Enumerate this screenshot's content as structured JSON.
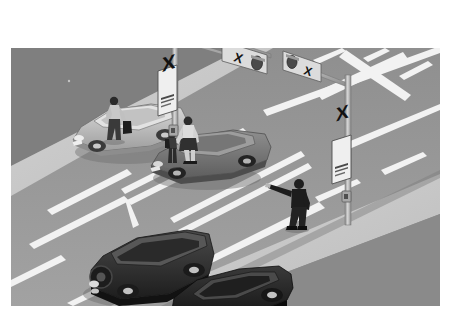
{
  "scene": {
    "title": "Road intersection with railway level crossing signals",
    "type": "illustration",
    "palette": {
      "page_background": "#ffffff",
      "sky_or_far_road": "#8c8c8c",
      "road_surface": "#9a9a9a",
      "road_surface_dark": "#858585",
      "sidewalk": "#c9c9c9",
      "verge": "#b4b4b4",
      "lane_marking": "#f2f2f2",
      "pole_metal": "#b9b9b9",
      "pole_shadow": "#7e7e7e",
      "sign_face": "#f0f0f0",
      "sign_ink": "#1c1c1c",
      "signal_housing": "#dcdcdc",
      "car_light": "#c6c6c6",
      "car_mid": "#7c7c7c",
      "car_dark": "#2e2e2e",
      "car_black": "#1a1a1a",
      "person_dark": "#262626",
      "person_light": "#d0d0d0",
      "shadow": "#6f6f6f"
    },
    "frame": {
      "left": 11,
      "top": 48,
      "width": 429,
      "height": 258
    }
  },
  "signs": {
    "crossbuck_left": {
      "name": "railway-crossbuck-sign",
      "glyph": "X",
      "subtext": "RAILWAY CROSSING"
    },
    "crossbuck_right": {
      "name": "railway-crossbuck-sign",
      "glyph": "X",
      "subtext": "RAILWAY CROSSING"
    }
  },
  "signals": {
    "overhead_left": {
      "label": "overhead-crossing-signal",
      "glyph": "X",
      "lamp_count": 1,
      "lamp_state": "off"
    },
    "overhead_right": {
      "label": "overhead-crossing-signal",
      "glyph": "X",
      "lamp_count": 1,
      "lamp_state": "off"
    }
  },
  "poles": [
    {
      "name": "signal-mast-left",
      "has_mast_arm": true,
      "has_control_box": true
    },
    {
      "name": "signal-mast-right",
      "has_mast_arm": true,
      "has_control_box": true
    }
  ],
  "vehicles": [
    {
      "name": "silver-sedan",
      "color": "#c6c6c6",
      "position": "upper-left-lane",
      "heading": "right"
    },
    {
      "name": "gray-sedan",
      "color": "#7c7c7c",
      "position": "upper-right-lane",
      "heading": "right"
    },
    {
      "name": "dark-suv",
      "color": "#2e2e2e",
      "position": "lower-left-lane",
      "heading": "left",
      "has_spare_tire": true
    },
    {
      "name": "black-sedan",
      "color": "#1a1a1a",
      "position": "lower-right-lane",
      "heading": "left"
    }
  ],
  "pedestrians": [
    {
      "name": "man-with-bag",
      "description": "man walking on sidewalk carrying a bag",
      "clothing": "light shirt, dark trousers"
    },
    {
      "name": "woman-with-child",
      "description": "woman holding child's hand crossing at crosswalk",
      "clothing": "light top, dark skirt"
    },
    {
      "name": "child",
      "description": "child with backpack held by the hand",
      "clothing": "dark outfit"
    },
    {
      "name": "person-pointing",
      "description": "person in dark clothing with arm extended pointing",
      "clothing": "dark jacket and trousers"
    }
  ],
  "road_markings": {
    "crosswalk": "ladder crosswalk across the near roadway",
    "stop_line": "transverse stop line before the crossing",
    "lane_lines": "dashed and solid white lane separators",
    "crossing_hazard_marking": "large painted X on the far roadway"
  }
}
